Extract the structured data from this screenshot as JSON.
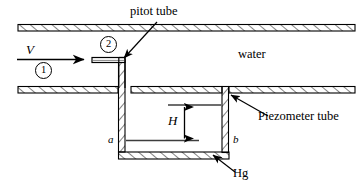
{
  "figure": {
    "labels": {
      "pitot_tube": "pitot tube",
      "water": "water",
      "piezometer_tube": "Piezometer tube",
      "mercury": "Hg",
      "velocity": "V",
      "height": "H",
      "point_a": "a",
      "point_b": "b",
      "station_1": "1",
      "station_2": "2"
    },
    "colors": {
      "line": "#000000",
      "background": "#ffffff",
      "hatch": "#222222"
    },
    "elements": {
      "upper_pipe_wall": "hatched-band",
      "lower_pipe_wall": "hatched-band",
      "flow_arrow": "rightward-arrow",
      "pitot_tube_shape": "L-shaped-tube",
      "manometer": "u-tube",
      "dimension_arrow": "double-headed-vertical"
    }
  }
}
